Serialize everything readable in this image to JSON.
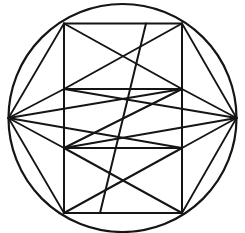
{
  "figure": {
    "background_color": "#ffffff",
    "stroke_color": "#151515",
    "canvas": {
      "width": 245,
      "height": 233
    }
  },
  "geometry": {
    "circle": {
      "name": "outer-circle",
      "cx": 122.5,
      "cy": 118,
      "r": 114,
      "stroke_width": 2.2
    },
    "points": {
      "left": {
        "x": 8.5,
        "y": 118
      },
      "right": {
        "x": 236.5,
        "y": 118
      },
      "top_left": {
        "x": 64,
        "y": 23.5
      },
      "top_right": {
        "x": 182,
        "y": 23.5
      },
      "mid_upper_left": {
        "x": 64,
        "y": 89
      },
      "mid_upper_right": {
        "x": 182,
        "y": 89
      },
      "mid_lower_left": {
        "x": 64,
        "y": 148
      },
      "mid_lower_right": {
        "x": 182,
        "y": 148
      },
      "bottom_left": {
        "x": 64,
        "y": 213
      },
      "bottom_right": {
        "x": 182,
        "y": 213
      }
    },
    "stroke_width_main": 2.0,
    "stroke_width_thin": 1.8,
    "segments": [
      {
        "name": "top-edge",
        "x1": 64,
        "y1": 23.5,
        "x2": 182,
        "y2": 23.5
      },
      {
        "name": "bottom-edge",
        "x1": 64,
        "y1": 213,
        "x2": 182,
        "y2": 213
      },
      {
        "name": "left-vertical-edge",
        "x1": 64,
        "y1": 23.5,
        "x2": 64,
        "y2": 213
      },
      {
        "name": "right-vertical-edge",
        "x1": 182,
        "y1": 23.5,
        "x2": 182,
        "y2": 213
      },
      {
        "name": "upper-horizontal-divider",
        "x1": 64,
        "y1": 89,
        "x2": 182,
        "y2": 89
      },
      {
        "name": "lower-horizontal-divider",
        "x1": 64,
        "y1": 148,
        "x2": 182,
        "y2": 148
      },
      {
        "name": "top-band-diagonal-down",
        "x1": 64,
        "y1": 23.5,
        "x2": 182,
        "y2": 89
      },
      {
        "name": "top-band-diagonal-up",
        "x1": 64,
        "y1": 89,
        "x2": 182,
        "y2": 23.5
      },
      {
        "name": "bottom-band-diagonal-down",
        "x1": 64,
        "y1": 148,
        "x2": 182,
        "y2": 213
      },
      {
        "name": "bottom-band-diagonal-up",
        "x1": 64,
        "y1": 213,
        "x2": 182,
        "y2": 148
      },
      {
        "name": "long-diagonal-lower-left-to-upper-right",
        "x1": 64,
        "y1": 148,
        "x2": 182,
        "y2": 89
      },
      {
        "name": "long-diagonal-inner-rising",
        "x1": 100,
        "y1": 213,
        "x2": 146,
        "y2": 23.5
      },
      {
        "name": "chord-left-to-top-left",
        "x1": 8.5,
        "y1": 118,
        "x2": 64,
        "y2": 23.5
      },
      {
        "name": "chord-left-to-mid-upper",
        "x1": 8.5,
        "y1": 118,
        "x2": 182,
        "y2": 89
      },
      {
        "name": "chord-left-to-mid-lower",
        "x1": 8.5,
        "y1": 118,
        "x2": 182,
        "y2": 148
      },
      {
        "name": "chord-left-to-bottom-left",
        "x1": 8.5,
        "y1": 118,
        "x2": 64,
        "y2": 213
      },
      {
        "name": "chord-left-to-upper-corner",
        "x1": 8.5,
        "y1": 118,
        "x2": 64,
        "y2": 89
      },
      {
        "name": "chord-left-to-lower-corner",
        "x1": 8.5,
        "y1": 118,
        "x2": 64,
        "y2": 148
      },
      {
        "name": "chord-right-to-top-right",
        "x1": 236.5,
        "y1": 118,
        "x2": 182,
        "y2": 23.5
      },
      {
        "name": "chord-right-to-bottom-right",
        "x1": 236.5,
        "y1": 118,
        "x2": 182,
        "y2": 213
      },
      {
        "name": "chord-right-to-upper-corner",
        "x1": 236.5,
        "y1": 118,
        "x2": 182,
        "y2": 89
      },
      {
        "name": "chord-right-to-lower-corner",
        "x1": 236.5,
        "y1": 118,
        "x2": 182,
        "y2": 148
      },
      {
        "name": "chord-right-to-far-upper-left",
        "x1": 236.5,
        "y1": 118,
        "x2": 64,
        "y2": 89
      },
      {
        "name": "chord-right-to-far-lower-left",
        "x1": 236.5,
        "y1": 118,
        "x2": 64,
        "y2": 148
      }
    ]
  }
}
